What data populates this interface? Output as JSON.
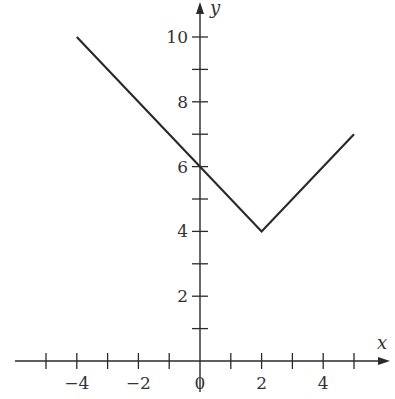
{
  "chart_data": {
    "type": "line",
    "title": "",
    "xlabel": "x",
    "ylabel": "y",
    "x": [
      -4,
      2,
      5
    ],
    "series": [
      {
        "name": "f(x)",
        "values": [
          10,
          4,
          7
        ]
      }
    ],
    "xlim": [
      -5.2,
      5.8
    ],
    "ylim": [
      -0.5,
      10.8
    ],
    "x_ticks": [
      -5,
      -4,
      -3,
      -2,
      -1,
      0,
      1,
      2,
      3,
      4,
      5
    ],
    "x_tick_labels": [
      "-4",
      "-2",
      "0",
      "2",
      "4"
    ],
    "x_tick_label_values": [
      -4,
      -2,
      0,
      2,
      4
    ],
    "y_ticks": [
      1,
      2,
      3,
      4,
      5,
      6,
      7,
      8,
      9,
      10
    ],
    "y_tick_labels": [
      "2",
      "4",
      "6",
      "8",
      "10"
    ],
    "y_tick_label_values": [
      2,
      4,
      6,
      8,
      10
    ],
    "grid": false,
    "legend": "none"
  },
  "axes": {
    "x_label": "x",
    "y_label": "y",
    "x_tick_texts": [
      "−4",
      "−2",
      "0",
      "2",
      "4"
    ],
    "y_tick_texts": [
      "2",
      "4",
      "6",
      "8",
      "10"
    ]
  },
  "colors": {
    "line": "#2a2a2a",
    "axis": "#2a2a2a",
    "text": "#333333"
  }
}
